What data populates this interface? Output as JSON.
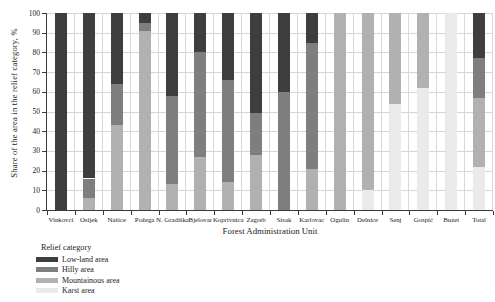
{
  "chart_data": {
    "type": "bar",
    "stacked": true,
    "title": "",
    "xlabel": "Forest Administration Unit",
    "ylabel": "Share of the area in the relief category, %",
    "ylim": [
      0,
      100
    ],
    "ytick_step": 10,
    "grid": true,
    "legend_title": "Relief category",
    "legend_position": "bottom-left",
    "categories": [
      "Vinkovci",
      "Osijek",
      "Našice",
      "Požega",
      "N. Gradiška",
      "Bjelovar",
      "Koprivnica",
      "Zagreb",
      "Sisak",
      "Karlovac",
      "Ogulin",
      "Delnice",
      "Senj",
      "Gospić",
      "Buzet",
      "Total"
    ],
    "series": [
      {
        "name": "Low-land area",
        "color": "#3e3e3e",
        "values": [
          100,
          84,
          36,
          5,
          42,
          20,
          34,
          51,
          40,
          15,
          0,
          0,
          0,
          0,
          0,
          23
        ]
      },
      {
        "name": "Hilly area",
        "color": "#7e7e7e",
        "values": [
          0,
          10,
          21,
          4,
          45,
          53,
          52,
          21,
          60,
          64,
          0,
          0,
          0,
          0,
          0,
          20
        ]
      },
      {
        "name": "Mountainous area",
        "color": "#b1b1b1",
        "values": [
          0,
          6,
          43,
          91,
          13,
          27,
          14,
          28,
          0,
          21,
          100,
          90,
          46,
          38,
          0,
          35
        ]
      },
      {
        "name": "Karst area",
        "color": "#eaeaea",
        "values": [
          0,
          0,
          0,
          0,
          0,
          0,
          0,
          0,
          0,
          0,
          0,
          10,
          54,
          62,
          100,
          22
        ]
      }
    ],
    "colors": {
      "grid": "#d6d6d6",
      "axis": "#3a3a3a",
      "text": "#222222"
    }
  }
}
